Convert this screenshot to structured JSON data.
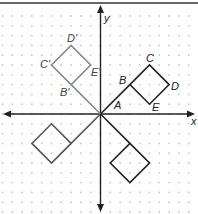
{
  "figure": {
    "grid": {
      "min": -10,
      "max": 10,
      "spacing_px": 9.8,
      "origin_px": [
        100.5,
        114
      ],
      "dot_color": "#c8c8c8"
    },
    "axes": {
      "x_label": "x",
      "y_label": "y",
      "color": "#222222"
    },
    "shapes": [
      {
        "name": "original-figure",
        "color": "#222222",
        "segment": [
          [
            0,
            0
          ],
          [
            3,
            3
          ]
        ],
        "square": [
          [
            3,
            3
          ],
          [
            5,
            5
          ],
          [
            7,
            3
          ],
          [
            5,
            1
          ]
        ],
        "labels": {
          "A": "A",
          "B": "B",
          "C": "C",
          "D": "D",
          "E": "E"
        }
      },
      {
        "name": "reflected-figure-y-axis",
        "color": "#8a8a8a",
        "segment": [
          [
            0,
            0
          ],
          [
            -3,
            3
          ]
        ],
        "square": [
          [
            -3,
            3
          ],
          [
            -5,
            5
          ],
          [
            -3,
            7
          ],
          [
            -1,
            5
          ]
        ],
        "labels": {
          "B": "B'",
          "C": "C'",
          "D": "D'",
          "E": "E'"
        }
      },
      {
        "name": "rotated-figure-180",
        "color": "#555555",
        "segment": [
          [
            0,
            0
          ],
          [
            -3,
            -3
          ]
        ],
        "square": [
          [
            -3,
            -3
          ],
          [
            -5,
            -1
          ],
          [
            -7,
            -3
          ],
          [
            -5,
            -5
          ]
        ]
      },
      {
        "name": "reflected-figure-x-axis",
        "color": "#222222",
        "segment": [
          [
            0,
            0
          ],
          [
            3,
            -3
          ]
        ],
        "square": [
          [
            3,
            -3
          ],
          [
            5,
            -5
          ],
          [
            3,
            -7
          ],
          [
            1,
            -5
          ]
        ]
      }
    ],
    "labels": {
      "A": "A",
      "B": "B",
      "C": "C",
      "D": "D",
      "E": "E",
      "B_prime": "B'",
      "C_prime": "C'",
      "D_prime": "D'",
      "E_prime": "E'"
    }
  }
}
